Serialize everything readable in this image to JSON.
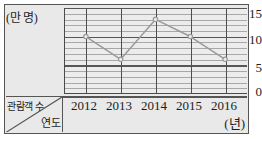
{
  "chart_data": {
    "type": "line",
    "title": "",
    "subtitle": "",
    "xlabel": "연도",
    "ylabel": "관람객 수",
    "x_unit": "(년)",
    "y_unit": "(만 명)",
    "categories": [
      "2012",
      "2013",
      "2014",
      "2015",
      "2016"
    ],
    "values": [
      10,
      6,
      13,
      10,
      6
    ],
    "series": [
      {
        "name": "관람객 수",
        "values": [
          10,
          6,
          13,
          10,
          6
        ]
      }
    ],
    "ylim": [
      0,
      15
    ],
    "y_major_ticks": [
      "0",
      "5",
      "10",
      "15"
    ],
    "y_major_tick_values": [
      0,
      5,
      10,
      15
    ],
    "y_minor_step": 1,
    "xlim_categories": [
      "2012",
      "2016"
    ],
    "grid": true,
    "grid_major_color": "#565656",
    "grid_minor_color": "#a8a8a8",
    "legend": "none",
    "legend_position": "none",
    "line_color": "#9a9a9a",
    "marker": "open-circle",
    "marker_color": "#9a9a9a",
    "annotations": []
  },
  "axes": {
    "y_unit_caption": "(만 명)",
    "x_unit_caption": "(년)",
    "corner_top_label": "관람객 수",
    "corner_bottom_label": "연도",
    "y_ticks": [
      {
        "label": "15",
        "value": 15
      },
      {
        "label": "10",
        "value": 10
      },
      {
        "label": "5",
        "value": 5
      },
      {
        "label": "0",
        "value": 0
      }
    ],
    "x_ticks": [
      {
        "label": "2012"
      },
      {
        "label": "2013"
      },
      {
        "label": "2014"
      },
      {
        "label": "2015"
      },
      {
        "label": "2016"
      }
    ]
  },
  "colors": {
    "background": "#e9e9e9",
    "plot_background": "#ececec",
    "frame": "#555555",
    "axis": "#4a4a4a",
    "text": "#1d1d1d",
    "series": "#9a9a9a"
  }
}
